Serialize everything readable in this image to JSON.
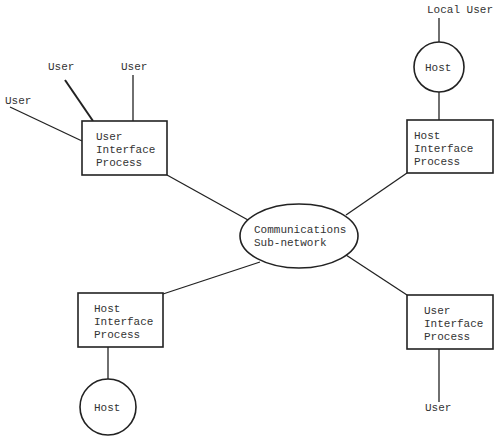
{
  "diagram": {
    "center": {
      "line1": "Communications",
      "line2": "Sub-network"
    },
    "nodes": {
      "top_left_uip": {
        "line1": "User",
        "line2": "Interface",
        "line3": "Process"
      },
      "top_right_hip": {
        "line1": "Host",
        "line2": "Interface",
        "line3": "Process"
      },
      "bottom_left_hip": {
        "line1": "Host",
        "line2": "Interface",
        "line3": "Process"
      },
      "bottom_right_uip": {
        "line1": "User",
        "line2": "Interface",
        "line3": "Process"
      }
    },
    "hosts": {
      "top_right": "Host",
      "bottom_left": "Host"
    },
    "users": {
      "tl_1": "User",
      "tl_2": "User",
      "tl_3": "User",
      "top_right_local": "Local User",
      "bottom_right": "User"
    }
  }
}
